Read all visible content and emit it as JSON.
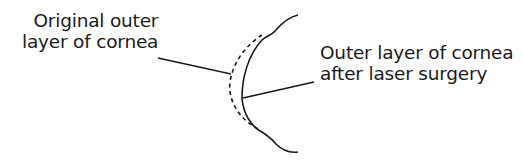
{
  "diagram": {
    "labels": {
      "original": {
        "line1": "Original outer",
        "line2": "layer of cornea"
      },
      "after": {
        "line1": "Outer layer of cornea",
        "line2": "after laser surgery"
      }
    },
    "legend": {
      "dashed_curve": "Original outer layer of cornea",
      "solid_curve": "Outer layer of cornea after laser surgery"
    },
    "colors": {
      "stroke": "#1a1a1a",
      "background": "#ffffff"
    }
  }
}
